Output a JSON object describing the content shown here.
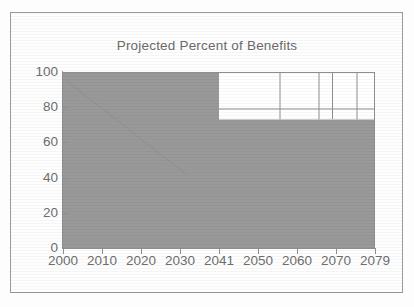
{
  "chart_data": {
    "type": "area",
    "title": "Projected Percent of Benefits\nThat Can Be Paid with No Charges",
    "title_line1": "Projected Percent of Benefits",
    "title_line2": "That Can Be Paid with No Charges",
    "xlabel": "",
    "ylabel": "",
    "xlim": [
      2000,
      2079
    ],
    "ylim": [
      0,
      100
    ],
    "grid": true,
    "legend": false,
    "x_ticks": [
      "2000",
      "2010",
      "2020",
      "2030",
      "2041",
      "2050",
      "2060",
      "2070",
      "2079"
    ],
    "x_tick_values": [
      2000,
      2010,
      2020,
      2030,
      2041,
      2050,
      2060,
      2070,
      2079
    ],
    "y_ticks": [
      "0",
      "20",
      "40",
      "60",
      "80",
      "100"
    ],
    "y_tick_values": [
      0,
      20,
      40,
      60,
      80,
      100
    ],
    "series": [
      {
        "name": "Percent of benefits payable",
        "step": "post",
        "x": [
          2000,
          2041,
          2079
        ],
        "values": [
          100,
          73,
          73
        ],
        "fill_color": "#999999"
      },
      {
        "name": "Upper reference line after 2041",
        "step": "post",
        "x": [
          2041,
          2079
        ],
        "values": [
          79,
          79
        ],
        "line_color": "#8e8e8e"
      }
    ],
    "gridlines_x": [
      2050,
      2060,
      2070
    ],
    "annotations": [
      {
        "text": "Shaded region = 100% of benefits payable through 2041",
        "value": 100
      },
      {
        "text": "After 2041 payable share drops to about 73%",
        "value": 73
      },
      {
        "text": "Thin horizontal reference line near 79%",
        "value": 79
      }
    ]
  },
  "colors": {
    "fill": "#999999",
    "axis": "#8e8e8e",
    "text": "#6e6e6e",
    "frame": "#9a9a9a",
    "background": "#ffffff"
  }
}
